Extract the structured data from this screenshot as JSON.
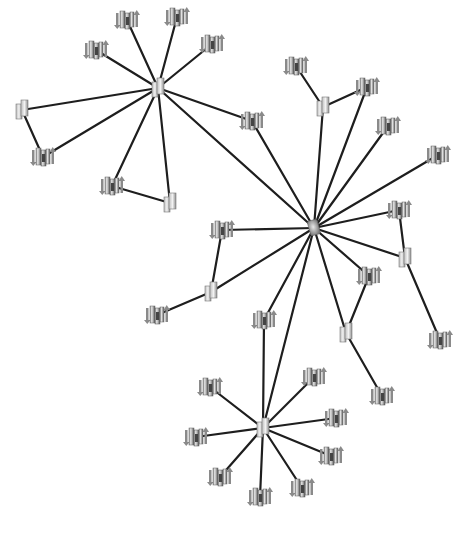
{
  "diagram": {
    "title": "",
    "type": "network-topology",
    "colors": {
      "background": "#ffffff",
      "edge": "#1e1e1e",
      "icon_light": "#d9d9d9",
      "icon_mid": "#9a9a9a",
      "icon_dark": "#555555"
    },
    "nodes": [
      {
        "id": "hubA",
        "kind": "switch",
        "x": 158,
        "y": 88
      },
      {
        "id": "hubB",
        "kind": "hub",
        "x": 314,
        "y": 228
      },
      {
        "id": "hubC",
        "kind": "switch",
        "x": 263,
        "y": 428
      },
      {
        "id": "sA1",
        "kind": "server",
        "x": 127,
        "y": 20
      },
      {
        "id": "sA2",
        "kind": "server",
        "x": 177,
        "y": 17
      },
      {
        "id": "sA3",
        "kind": "server",
        "x": 96,
        "y": 50
      },
      {
        "id": "sA4",
        "kind": "server",
        "x": 212,
        "y": 44
      },
      {
        "id": "swA1",
        "kind": "switch",
        "x": 22,
        "y": 110
      },
      {
        "id": "sA5",
        "kind": "server",
        "x": 43,
        "y": 157
      },
      {
        "id": "sA6",
        "kind": "server",
        "x": 112,
        "y": 186
      },
      {
        "id": "swA2",
        "kind": "switch",
        "x": 170,
        "y": 203
      },
      {
        "id": "sA7",
        "kind": "server",
        "x": 252,
        "y": 121
      },
      {
        "id": "sB1",
        "kind": "server",
        "x": 296,
        "y": 66
      },
      {
        "id": "swB1",
        "kind": "switch",
        "x": 323,
        "y": 107
      },
      {
        "id": "sB2",
        "kind": "server",
        "x": 367,
        "y": 87
      },
      {
        "id": "sB3",
        "kind": "server",
        "x": 388,
        "y": 126
      },
      {
        "id": "sB4",
        "kind": "server",
        "x": 438,
        "y": 155
      },
      {
        "id": "sB5",
        "kind": "server",
        "x": 399,
        "y": 210
      },
      {
        "id": "swB2",
        "kind": "switch",
        "x": 405,
        "y": 258
      },
      {
        "id": "sB6",
        "kind": "server",
        "x": 440,
        "y": 340
      },
      {
        "id": "sB7",
        "kind": "server",
        "x": 369,
        "y": 276
      },
      {
        "id": "swB3",
        "kind": "switch",
        "x": 346,
        "y": 333
      },
      {
        "id": "sB8",
        "kind": "server",
        "x": 382,
        "y": 396
      },
      {
        "id": "sB9",
        "kind": "server",
        "x": 222,
        "y": 230
      },
      {
        "id": "swB4",
        "kind": "switch",
        "x": 211,
        "y": 292
      },
      {
        "id": "sB10",
        "kind": "server",
        "x": 157,
        "y": 315
      },
      {
        "id": "sB11",
        "kind": "server",
        "x": 264,
        "y": 320
      },
      {
        "id": "sC1",
        "kind": "server",
        "x": 210,
        "y": 387
      },
      {
        "id": "sC2",
        "kind": "server",
        "x": 314,
        "y": 377
      },
      {
        "id": "sC3",
        "kind": "server",
        "x": 196,
        "y": 437
      },
      {
        "id": "sC4",
        "kind": "server",
        "x": 336,
        "y": 418
      },
      {
        "id": "sC5",
        "kind": "server",
        "x": 331,
        "y": 456
      },
      {
        "id": "sC6",
        "kind": "server",
        "x": 220,
        "y": 477
      },
      {
        "id": "sC7",
        "kind": "server",
        "x": 302,
        "y": 488
      },
      {
        "id": "sC8",
        "kind": "server",
        "x": 260,
        "y": 497
      }
    ],
    "edges": [
      [
        "hubA",
        "sA1"
      ],
      [
        "hubA",
        "sA2"
      ],
      [
        "hubA",
        "sA3"
      ],
      [
        "hubA",
        "sA4"
      ],
      [
        "hubA",
        "swA1"
      ],
      [
        "swA1",
        "sA5"
      ],
      [
        "hubA",
        "sA5"
      ],
      [
        "hubA",
        "sA6"
      ],
      [
        "sA6",
        "swA2"
      ],
      [
        "hubA",
        "swA2"
      ],
      [
        "hubA",
        "sA7"
      ],
      [
        "hubA",
        "hubB"
      ],
      [
        "sA7",
        "hubB"
      ],
      [
        "sB1",
        "swB1"
      ],
      [
        "swB1",
        "sB2"
      ],
      [
        "swB1",
        "hubB"
      ],
      [
        "sB2",
        "hubB"
      ],
      [
        "sB3",
        "hubB"
      ],
      [
        "sB4",
        "hubB"
      ],
      [
        "sB5",
        "hubB"
      ],
      [
        "sB5",
        "swB2"
      ],
      [
        "swB2",
        "hubB"
      ],
      [
        "swB2",
        "sB6"
      ],
      [
        "hubB",
        "sB7"
      ],
      [
        "sB7",
        "swB3"
      ],
      [
        "hubB",
        "swB3"
      ],
      [
        "swB3",
        "sB8"
      ],
      [
        "hubB",
        "sB9"
      ],
      [
        "sB9",
        "swB4"
      ],
      [
        "swB4",
        "hubB"
      ],
      [
        "swB4",
        "sB10"
      ],
      [
        "hubB",
        "sB11"
      ],
      [
        "sB11",
        "hubC"
      ],
      [
        "hubB",
        "hubC"
      ],
      [
        "hubC",
        "sC1"
      ],
      [
        "hubC",
        "sC2"
      ],
      [
        "hubC",
        "sC3"
      ],
      [
        "hubC",
        "sC4"
      ],
      [
        "hubC",
        "sC5"
      ],
      [
        "hubC",
        "sC6"
      ],
      [
        "hubC",
        "sC7"
      ],
      [
        "hubC",
        "sC8"
      ]
    ]
  }
}
